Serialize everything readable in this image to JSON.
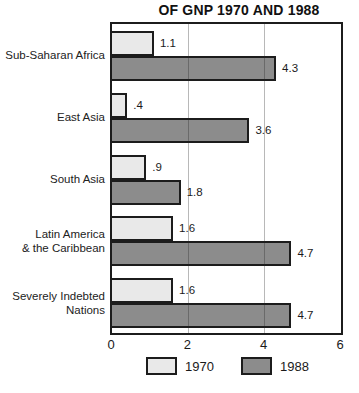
{
  "chart_data": {
    "type": "bar",
    "orientation": "horizontal",
    "title": "OF GNP 1970 AND 1988",
    "categories": [
      "Sub-Saharan Africa",
      "East Asia",
      "South Asia",
      "Latin America & the Caribbean",
      "Severely Indebted Nations"
    ],
    "category_lines": [
      [
        "Sub-Saharan Africa"
      ],
      [
        "East Asia"
      ],
      [
        "South Asia"
      ],
      [
        "Latin America",
        "& the Caribbean"
      ],
      [
        "Severely Indebted",
        "Nations"
      ]
    ],
    "series": [
      {
        "name": "1970",
        "values": [
          1.1,
          0.4,
          0.9,
          1.6,
          1.6
        ],
        "labels": [
          "1.1",
          ".4",
          ".9",
          "1.6",
          "1.6"
        ],
        "color": "#e9e9e9"
      },
      {
        "name": "1988",
        "values": [
          4.3,
          3.6,
          1.8,
          4.7,
          4.7
        ],
        "labels": [
          "4.3",
          "3.6",
          "1.8",
          "4.7",
          "4.7"
        ],
        "color": "#8c8c8c"
      }
    ],
    "xlim": [
      0,
      6
    ],
    "xticks": [
      "0",
      "2",
      "4",
      "6"
    ],
    "xtick_values": [
      0,
      2,
      4,
      6
    ],
    "gridline_values": [
      2,
      4
    ],
    "grid": "on",
    "legend_position": "bottom",
    "bar_border_color": "#1c1c1c",
    "gridline_color": "rgba(35,35,35,0.32)"
  }
}
